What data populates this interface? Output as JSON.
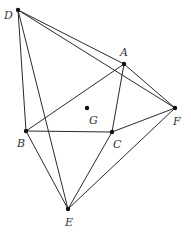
{
  "diagram": {
    "points": {
      "D": {
        "label": "D",
        "x": 18,
        "y": 10,
        "lx": 4,
        "ly": 19
      },
      "A": {
        "label": "A",
        "x": 124,
        "y": 64,
        "lx": 120,
        "ly": 56
      },
      "F": {
        "label": "F",
        "x": 175,
        "y": 108,
        "lx": 174,
        "ly": 125
      },
      "G": {
        "label": "G",
        "x": 87,
        "y": 108,
        "lx": 89,
        "ly": 124
      },
      "B": {
        "label": "B",
        "x": 26,
        "y": 131,
        "lx": 17,
        "ly": 147
      },
      "C": {
        "label": "C",
        "x": 112,
        "y": 132,
        "lx": 113,
        "ly": 148
      },
      "E": {
        "label": "E",
        "x": 68,
        "y": 209,
        "lx": 65,
        "ly": 226
      }
    },
    "edges": [
      [
        "D",
        "A"
      ],
      [
        "D",
        "F"
      ],
      [
        "D",
        "B"
      ],
      [
        "D",
        "E"
      ],
      [
        "A",
        "B"
      ],
      [
        "A",
        "C"
      ],
      [
        "A",
        "F"
      ],
      [
        "B",
        "C"
      ],
      [
        "B",
        "E"
      ],
      [
        "C",
        "F"
      ],
      [
        "C",
        "E"
      ],
      [
        "E",
        "F"
      ]
    ],
    "colors": {
      "line": "#2a2a2a",
      "point": "#111111",
      "label": "#333333"
    }
  }
}
